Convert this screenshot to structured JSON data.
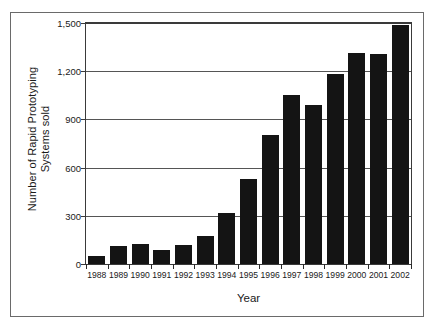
{
  "chart_data": {
    "type": "bar",
    "title": "",
    "xlabel": "Year",
    "ylabel": "Number of Rapid Prototyping Systems sold",
    "ylabel_lines": [
      "Number of Rapid Prototyping",
      "Systems sold"
    ],
    "categories": [
      "1988",
      "1989",
      "1990",
      "1991",
      "1992",
      "1993",
      "1994",
      "1995",
      "1996",
      "1997",
      "1998",
      "1999",
      "2000",
      "2001",
      "2002"
    ],
    "values": [
      50,
      115,
      125,
      90,
      120,
      175,
      320,
      530,
      805,
      1055,
      990,
      1185,
      1315,
      1305,
      1490
    ],
    "ylim": [
      0,
      1500
    ],
    "xlim_labels": [
      "1988",
      "2002"
    ],
    "ytick_values": [
      0,
      300,
      600,
      900,
      1200,
      1500
    ],
    "ytick_labels": [
      "0",
      "300",
      "600",
      "900",
      "1,200",
      "1,500"
    ],
    "grid": true,
    "grid_axis": "y",
    "legend": false,
    "legend_position": "none",
    "bar_color": "#141414",
    "gridline_color": "#555555",
    "axis_color": "#3a3a3a",
    "frame_color": "#6a6a6a",
    "background_color": "#ffffff",
    "series": [
      {
        "name": "Rapid Prototyping Systems sold",
        "values": [
          50,
          115,
          125,
          90,
          120,
          175,
          320,
          530,
          805,
          1055,
          990,
          1185,
          1315,
          1305,
          1490
        ]
      }
    ]
  }
}
